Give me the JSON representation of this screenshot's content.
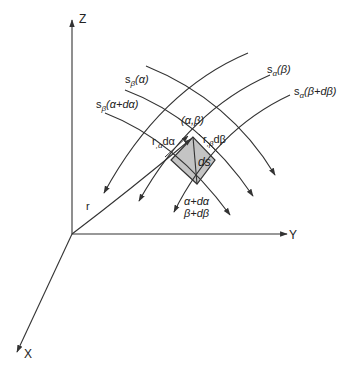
{
  "diagram": {
    "type": "curvilinear-coordinate-surface-element",
    "axes": {
      "z_label": "Z",
      "y_label": "Y",
      "x_label": "X"
    },
    "position_vector_label": "r",
    "curves": {
      "s_beta_alpha": {
        "base": "s",
        "sub": "β",
        "arg": "(α)"
      },
      "s_beta_alpha_dalpha": {
        "base": "s",
        "sub": "β",
        "arg": "(α+dα)"
      },
      "s_alpha_beta": {
        "base": "s",
        "sub": "α",
        "arg": "(β)"
      },
      "s_alpha_beta_dbeta": {
        "base": "s",
        "sub": "α",
        "arg": "(β+dβ)"
      }
    },
    "point_label": "(α,β)",
    "edge_alpha": {
      "base": "r",
      "sub": ",α",
      "tail": "dα"
    },
    "edge_beta": {
      "base": "r",
      "sub": ",β",
      "tail": "dβ"
    },
    "area_label": "ds",
    "far_corner": {
      "line1": "α+dα",
      "line2": "β+dβ"
    },
    "colors": {
      "stroke": "#333333",
      "fill": "#c4c4c4",
      "background": "#ffffff"
    }
  }
}
